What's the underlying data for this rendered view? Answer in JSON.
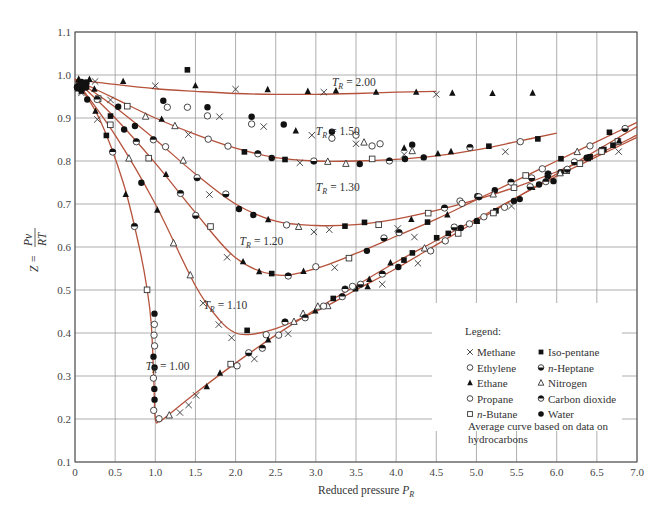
{
  "chart_data": {
    "type": "scatter",
    "title": "",
    "xlabel": "Reduced pressure P_R",
    "xlabel_main": "Reduced pressure ",
    "xlabel_var": "P",
    "xlabel_sub": "R",
    "ylabel": "Z = Pv/RT",
    "ylabel_parts": {
      "lhs": "Z =",
      "num": "Pv",
      "den": "RT"
    },
    "xlim": [
      0,
      7.0
    ],
    "ylim": [
      0.1,
      1.1
    ],
    "grid": true,
    "x_ticks": [
      "0",
      "0.5",
      "1.0",
      "1.5",
      "2.0",
      "2.5",
      "3.0",
      "3.5",
      "4.0",
      "4.5",
      "5.0",
      "5.5",
      "6.0",
      "6.5",
      "7.0"
    ],
    "y_ticks": [
      "0.1",
      "0.2",
      "0.3",
      "0.4",
      "0.5",
      "0.6",
      "0.7",
      "0.8",
      "0.9",
      "1.0",
      "1.1"
    ],
    "legend_position": "lower right",
    "legend": {
      "title": "Legend:",
      "entries": [
        {
          "marker": "x",
          "label": "Methane"
        },
        {
          "marker": "open-circle",
          "label": "Ethylene"
        },
        {
          "marker": "filled-triangle",
          "label": "Ethane"
        },
        {
          "marker": "open-circle",
          "label": "Propane"
        },
        {
          "marker": "open-square",
          "label": "n-Butane"
        },
        {
          "marker": "filled-square",
          "label": "Iso-pentane"
        },
        {
          "marker": "half-filled-circle-bottom",
          "label": "n-Heptane"
        },
        {
          "marker": "open-triangle",
          "label": "Nitrogen"
        },
        {
          "marker": "half-filled-circle-top",
          "label": "Carbon dioxide"
        },
        {
          "marker": "filled-circle",
          "label": "Water"
        }
      ],
      "note": "Average curve based on data on hydrocarbons",
      "note_line1": "Average curve based on data on",
      "note_line2": "hydrocarbons"
    },
    "curve_color": "#b5523b",
    "series": [
      {
        "name": "T_R = 2.00",
        "label_T": "T",
        "label_sub": "R",
        "label_val": "= 2.00",
        "label_pos": [
          3.2,
          0.975
        ],
        "x": [
          0.0,
          0.5,
          1.0,
          1.5,
          2.0,
          2.5,
          3.0,
          3.5,
          4.0,
          4.5
        ],
        "y": [
          0.99,
          0.978,
          0.968,
          0.962,
          0.957,
          0.955,
          0.955,
          0.957,
          0.96,
          0.962
        ]
      },
      {
        "name": "T_R = 1.50",
        "label_T": "T",
        "label_sub": "R",
        "label_val": "= 1.50",
        "label_pos": [
          3.0,
          0.86
        ],
        "x": [
          0.0,
          0.5,
          1.0,
          1.5,
          2.0,
          2.5,
          3.0,
          3.5,
          4.0,
          4.5,
          5.0,
          5.5,
          6.0
        ],
        "y": [
          0.99,
          0.945,
          0.9,
          0.862,
          0.83,
          0.808,
          0.8,
          0.8,
          0.804,
          0.812,
          0.826,
          0.845,
          0.865
        ]
      },
      {
        "name": "T_R = 1.30",
        "label_T": "T",
        "label_sub": "R",
        "label_val": "= 1.30",
        "label_pos": [
          3.0,
          0.73
        ],
        "x": [
          0.0,
          0.5,
          1.0,
          1.5,
          2.0,
          2.5,
          3.0,
          3.5,
          4.0,
          4.5,
          5.0,
          5.5,
          6.0,
          6.5,
          7.0
        ],
        "y": [
          0.99,
          0.925,
          0.85,
          0.77,
          0.7,
          0.66,
          0.65,
          0.652,
          0.665,
          0.685,
          0.71,
          0.74,
          0.775,
          0.815,
          0.86
        ]
      },
      {
        "name": "T_R = 1.20",
        "label_T": "T",
        "label_sub": "R",
        "label_val": "= 1.20",
        "label_pos": [
          2.05,
          0.605
        ],
        "x": [
          0.0,
          0.5,
          1.0,
          1.5,
          2.0,
          2.5,
          3.0,
          3.5,
          4.0,
          4.5,
          5.0,
          5.5,
          6.0,
          6.5,
          7.0
        ],
        "y": [
          0.99,
          0.9,
          0.795,
          0.68,
          0.575,
          0.535,
          0.55,
          0.585,
          0.625,
          0.665,
          0.71,
          0.755,
          0.8,
          0.845,
          0.89
        ]
      },
      {
        "name": "T_R = 1.10",
        "label_T": "T",
        "label_sub": "R",
        "label_val": "= 1.10",
        "label_pos": [
          1.6,
          0.455
        ],
        "x": [
          0.0,
          0.5,
          1.0,
          1.5,
          1.8,
          2.0,
          2.2,
          2.5,
          3.0,
          3.5,
          4.0,
          4.5,
          5.0,
          5.5,
          6.0,
          6.5,
          7.0
        ],
        "y": [
          0.99,
          0.86,
          0.7,
          0.51,
          0.43,
          0.4,
          0.397,
          0.41,
          0.45,
          0.5,
          0.55,
          0.605,
          0.66,
          0.715,
          0.77,
          0.825,
          0.88
        ]
      },
      {
        "name": "T_R = 1.00",
        "label_T": "T",
        "label_sub": "R",
        "label_val": "= 1.00",
        "label_pos": [
          0.88,
          0.315
        ],
        "x": [
          0.0,
          0.3,
          0.6,
          0.8,
          0.9,
          0.95,
          0.98,
          1.0,
          1.05,
          1.1,
          1.5,
          2.0,
          2.5,
          3.0,
          3.5,
          4.0,
          4.5,
          5.0,
          5.5,
          6.0,
          6.5,
          7.0
        ],
        "y": [
          0.99,
          0.9,
          0.75,
          0.6,
          0.5,
          0.42,
          0.3,
          0.2,
          0.195,
          0.2,
          0.26,
          0.33,
          0.395,
          0.455,
          0.51,
          0.565,
          0.615,
          0.665,
          0.715,
          0.765,
          0.81,
          0.855
        ]
      }
    ],
    "points": [
      {
        "m": "x",
        "x": 0.25,
        "y": 0.985
      },
      {
        "m": "ft",
        "x": 0.18,
        "y": 0.99
      },
      {
        "m": "ft",
        "x": 0.6,
        "y": 0.985
      },
      {
        "m": "x",
        "x": 1.0,
        "y": 0.975
      },
      {
        "m": "ft",
        "x": 1.5,
        "y": 0.975
      },
      {
        "m": "x",
        "x": 2.0,
        "y": 0.967
      },
      {
        "m": "ft",
        "x": 2.4,
        "y": 0.966
      },
      {
        "m": "ft",
        "x": 2.9,
        "y": 0.962
      },
      {
        "m": "x",
        "x": 3.1,
        "y": 0.96
      },
      {
        "m": "ft",
        "x": 3.25,
        "y": 0.963
      },
      {
        "m": "ft",
        "x": 3.75,
        "y": 0.96
      },
      {
        "m": "ft",
        "x": 4.25,
        "y": 0.96
      },
      {
        "m": "x",
        "x": 4.5,
        "y": 0.955
      },
      {
        "m": "ft",
        "x": 4.7,
        "y": 0.958
      },
      {
        "m": "ft",
        "x": 5.2,
        "y": 0.957
      },
      {
        "m": "ft",
        "x": 5.7,
        "y": 0.958
      },
      {
        "m": "x",
        "x": 7.9,
        "y": 0.96
      },
      {
        "m": "fs",
        "x": 1.4,
        "y": 1.012
      },
      {
        "m": "fc",
        "x": 1.1,
        "y": 0.94
      },
      {
        "m": "oc",
        "x": 1.15,
        "y": 0.925
      },
      {
        "m": "oc",
        "x": 1.4,
        "y": 0.925
      },
      {
        "m": "fc",
        "x": 1.65,
        "y": 0.925
      },
      {
        "m": "oc",
        "x": 1.65,
        "y": 0.905
      },
      {
        "m": "x",
        "x": 1.8,
        "y": 0.903
      },
      {
        "m": "fc",
        "x": 2.2,
        "y": 0.903
      },
      {
        "m": "oc",
        "x": 2.2,
        "y": 0.886
      },
      {
        "m": "x",
        "x": 2.35,
        "y": 0.88
      },
      {
        "m": "fc",
        "x": 2.6,
        "y": 0.885
      },
      {
        "m": "ft",
        "x": 2.75,
        "y": 0.87
      },
      {
        "m": "x",
        "x": 2.95,
        "y": 0.86
      },
      {
        "m": "oc",
        "x": 3.2,
        "y": 0.853
      },
      {
        "m": "fc",
        "x": 3.2,
        "y": 0.868
      },
      {
        "m": "oc",
        "x": 3.5,
        "y": 0.86
      },
      {
        "m": "x",
        "x": 3.5,
        "y": 0.84
      },
      {
        "m": "ot",
        "x": 3.6,
        "y": 0.843
      },
      {
        "m": "oc",
        "x": 3.7,
        "y": 0.835
      },
      {
        "m": "oc",
        "x": 3.8,
        "y": 0.84
      },
      {
        "m": "ft",
        "x": 4.1,
        "y": 0.83
      },
      {
        "m": "fc",
        "x": 4.2,
        "y": 0.838
      },
      {
        "m": "ot",
        "x": 4.2,
        "y": 0.823
      },
      {
        "m": "x",
        "x": 4.1,
        "y": 0.815
      }
    ],
    "points_note": "Scatter markers approximated visually; each curve is an average through the data."
  }
}
